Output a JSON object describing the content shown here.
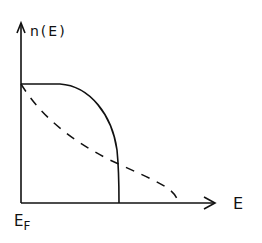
{
  "diagram": {
    "y_axis_label": "n(E)",
    "x_axis_label": "E",
    "origin_label_main": "E",
    "origin_label_sub": "F",
    "curves": [
      {
        "name": "solid",
        "style": "solid",
        "description": "flat then drops sharply to zero"
      },
      {
        "name": "dashed",
        "style": "dashed",
        "description": "roughly linear decrease, extends to higher E"
      }
    ],
    "colors": {
      "line": "#111111",
      "background": "#ffffff"
    }
  }
}
